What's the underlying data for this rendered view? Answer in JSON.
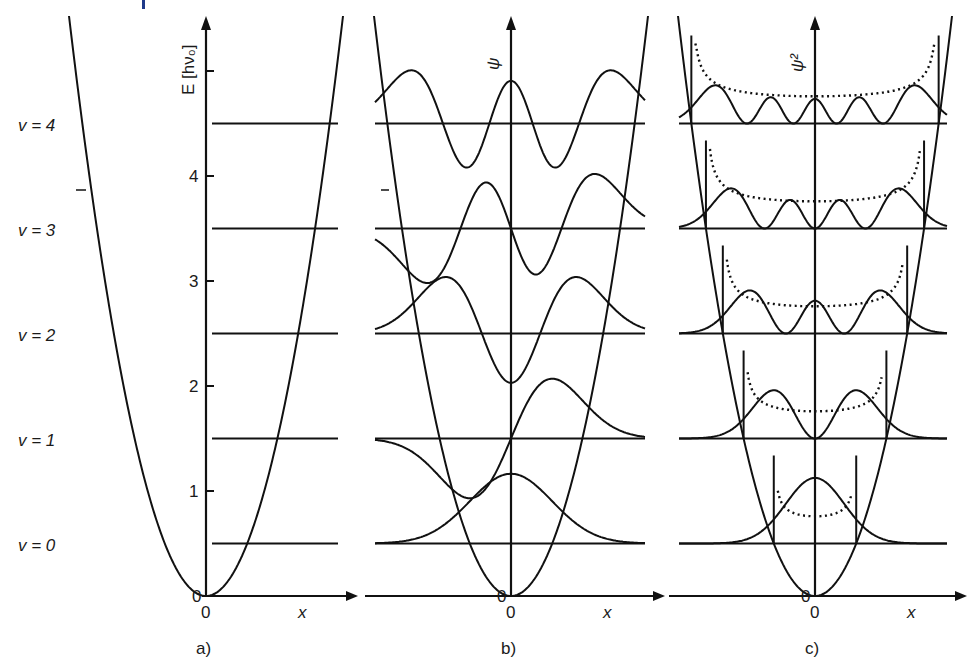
{
  "top_mark": {
    "color": "#1f3a8a"
  },
  "panels": [
    {
      "id": "a",
      "caption": "a)",
      "axis_label": "E [hν₀]",
      "x_label": "x",
      "origin_label": "0",
      "origin_label_y": "0",
      "show_wavefunction": "none"
    },
    {
      "id": "b",
      "caption": "b)",
      "axis_label": "ψ",
      "x_label": "x",
      "origin_label": "0",
      "origin_label_y": "0",
      "show_wavefunction": "psi"
    },
    {
      "id": "c",
      "caption": "c)",
      "axis_label": "ψ²",
      "x_label": "x",
      "origin_label": "0",
      "origin_label_y": "0",
      "show_wavefunction": "psi2"
    }
  ],
  "level_labels": [
    "v = 0",
    "v = 1",
    "v = 2",
    "v = 3",
    "v = 4"
  ],
  "energy_ticks": [
    "1",
    "2",
    "3",
    "4"
  ],
  "chart_data": {
    "type": "line",
    "ylabel": "E [hν₀]",
    "xlabel": "x",
    "ylim": [
      0,
      5.4
    ],
    "potential": "V(x) = parabola with vertex at E=0, x=0",
    "energy_levels": [
      {
        "v": 0,
        "E": 0.5
      },
      {
        "v": 1,
        "E": 1.5
      },
      {
        "v": 2,
        "E": 2.5
      },
      {
        "v": 3,
        "E": 3.5
      },
      {
        "v": 4,
        "E": 4.5
      }
    ],
    "y_ticks": [
      0,
      1,
      2,
      3,
      4,
      5
    ],
    "panels": [
      {
        "panel": "a",
        "content": "potential parabola + energy levels v=0..4"
      },
      {
        "panel": "b",
        "content": "wavefunctions ψ_v drawn on each level (solid)"
      },
      {
        "panel": "c",
        "content": "probability densities ψ_v² (solid) with classical probability density (dotted) and classical turning points (vertical bars)"
      }
    ]
  }
}
